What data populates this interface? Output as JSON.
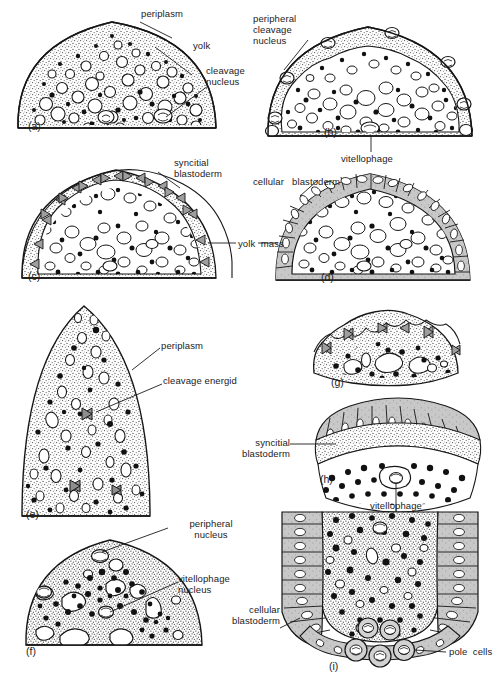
{
  "figure": {
    "panels": [
      {
        "id": "a",
        "letter": "(a)",
        "stage": "cleavage nuclei dispersed in yolk",
        "shape": "dome"
      },
      {
        "id": "b",
        "letter": "(b)",
        "stage": "peripheral cleavage nuclei migrate to periplasm",
        "shape": "dome"
      },
      {
        "id": "c",
        "letter": "(c)",
        "stage": "syncitial blastoderm formed",
        "shape": "dome"
      },
      {
        "id": "d",
        "letter": "(d)",
        "stage": "cellular blastoderm formed",
        "shape": "dome"
      },
      {
        "id": "e",
        "letter": "(e)",
        "stage": "cleavage energids in periplasm, anterior pole",
        "shape": "ogive"
      },
      {
        "id": "f",
        "letter": "(f)",
        "stage": "peripheral and vitellophage nuclei",
        "shape": "dome"
      },
      {
        "id": "g",
        "letter": "(g)",
        "stage": "energids at surface",
        "shape": "cap"
      },
      {
        "id": "h",
        "letter": "(h)",
        "stage": "syncitial blastoderm with vitellophage",
        "shape": "arc"
      },
      {
        "id": "i",
        "letter": "(i)",
        "stage": "cellular blastoderm with pole cells",
        "shape": "posterior"
      }
    ],
    "labels": {
      "periplasm": "periplasm",
      "yolk": "yolk",
      "cleavage_nucleus": "cleavage\nnucleus",
      "peripheral_cleavage_nucleus": "peripheral\ncleavage\nnucleus",
      "vitellophage": "vitellophage",
      "syncitial_blastoderm": "syncitial\nblastoderm",
      "yolk_mass": "yolk  mass",
      "cellular_blastoderm_d": "cellular   blastoderm",
      "periplasm_e": "periplasm",
      "cleavage_energid": "cleavage energid",
      "peripheral_nucleus": "peripheral\nnucleus",
      "vitellophage_nucleus": "vitellophage\nnucleus",
      "syncitial_blastoderm_h": "syncitial\nblastoderm",
      "vitellophage_h": "vitellophage",
      "cellular_blastoderm_i": "cellular\nblastoderm",
      "pole_cells": "pole  cells"
    },
    "panel_letters": {
      "a": "(a)",
      "b": "(b)",
      "c": "(c)",
      "d": "(d)",
      "e": "(e)",
      "f": "(f)",
      "g": "(g)",
      "h": "(h)",
      "i": "(i)"
    },
    "colors": {
      "ink": "#141414",
      "periplasm_fill": "#d8d8d8",
      "yolk_fill": "#ffffff",
      "cell_fill": "#c9c9c9",
      "background": "#ffffff"
    }
  }
}
